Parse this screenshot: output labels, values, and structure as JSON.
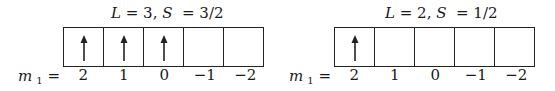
{
  "diagrams": [
    {
      "title": {
        "L_label": "L",
        "L_value": "3",
        "S_label": "S",
        "S_value": "3/2"
      },
      "m_label": {
        "symbol": "m",
        "subscript": "1",
        "equals": "="
      },
      "m_values": [
        "2",
        "1",
        "0",
        "−1",
        "−2"
      ],
      "cells": [
        {
          "arrow": "up"
        },
        {
          "arrow": "up"
        },
        {
          "arrow": "up"
        },
        {
          "arrow": "none"
        },
        {
          "arrow": "none"
        }
      ]
    },
    {
      "title": {
        "L_label": "L",
        "L_value": "2",
        "S_label": "S",
        "S_value": "1/2"
      },
      "m_label": {
        "symbol": "m",
        "subscript": "1",
        "equals": "="
      },
      "m_values": [
        "2",
        "1",
        "0",
        "−1",
        "−2"
      ],
      "cells": [
        {
          "arrow": "up"
        },
        {
          "arrow": "none"
        },
        {
          "arrow": "none"
        },
        {
          "arrow": "none"
        },
        {
          "arrow": "none"
        }
      ]
    }
  ],
  "colors": {
    "line": "#222222",
    "background": "#ffffff"
  }
}
